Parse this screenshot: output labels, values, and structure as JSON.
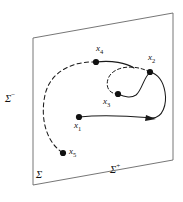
{
  "figure": {
    "type": "phase-space trajectory diagram",
    "surface": {
      "name_label": "Σ",
      "negative_side_label": "Σ−",
      "positive_side_label": "Σ+",
      "negative_superscript": "−",
      "positive_superscript": "+",
      "sigma": "Σ"
    },
    "points": [
      {
        "id": "x1",
        "base": "x",
        "sub": "1",
        "x": 79,
        "y": 117,
        "label_dx": -5,
        "label_dy": 8
      },
      {
        "id": "x2",
        "base": "x",
        "sub": "2",
        "x": 150,
        "y": 72,
        "label_dx": -2,
        "label_dy": -15
      },
      {
        "id": "x3",
        "base": "x",
        "sub": "3",
        "x": 118,
        "y": 94,
        "label_dx": -15,
        "label_dy": 7
      },
      {
        "id": "x4",
        "base": "x",
        "sub": "4",
        "x": 96,
        "y": 62,
        "label_dx": 0,
        "label_dy": -16
      },
      {
        "id": "x5",
        "base": "x",
        "sub": "5",
        "x": 63,
        "y": 153,
        "label_dx": 6,
        "label_dy": -5
      }
    ],
    "curves": [
      {
        "name": "dashed-outer-arc",
        "style": "dashed"
      },
      {
        "name": "dashed-inner-loop",
        "style": "dashed"
      },
      {
        "name": "solid-outer-spiral",
        "style": "solid"
      },
      {
        "name": "solid-inner-arc",
        "style": "solid"
      }
    ],
    "arrow": {
      "name": "flow-direction-arrow",
      "x": 151,
      "y": 118
    },
    "colors": {
      "ink": "#1a1a1a",
      "plane_edge": "#555555",
      "background": "#ffffff"
    }
  }
}
